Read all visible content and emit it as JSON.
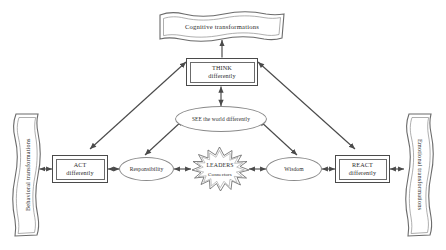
{
  "diagram": {
    "colors": {
      "stroke_strong": "#4a4a4a",
      "stroke_light": "#8a8a8a",
      "text": "#2b2b2b",
      "background": "#ffffff"
    },
    "banners": {
      "top": {
        "label": "Cognitive transformations",
        "shape": "wavy-ribbon-horizontal"
      },
      "left": {
        "label": "Behavioral transformations",
        "shape": "wavy-ribbon-vertical",
        "text_direction": "bottom-to-top"
      },
      "right": {
        "label": "Emotional transformations",
        "shape": "wavy-ribbon-vertical",
        "text_direction": "top-to-bottom"
      }
    },
    "boxes": {
      "think": {
        "line1": "THINK",
        "line2": "differently",
        "shape": "double-border-rectangle"
      },
      "act": {
        "line1": "ACT",
        "line2": "differently",
        "shape": "double-border-rectangle"
      },
      "react": {
        "line1": "REACT",
        "line2": "differently",
        "shape": "double-border-rectangle"
      }
    },
    "ellipses": {
      "see": {
        "label": "SEE the world differently"
      },
      "responsibility": {
        "label": "Responsibility"
      },
      "wisdom": {
        "label": "Wisdom"
      }
    },
    "star": {
      "line1": "LEADERS",
      "line2": "Connectors",
      "shape": "explosion-starburst"
    },
    "connectors": [
      {
        "from": "see",
        "to": "think",
        "style": "double-arrow-vertical"
      },
      {
        "from": "think",
        "to": "cognitive-transformations",
        "style": "single-arrow-up"
      },
      {
        "from": "act",
        "to": "think",
        "style": "double-arrow-diagonal"
      },
      {
        "from": "think",
        "to": "react",
        "style": "double-arrow-diagonal"
      },
      {
        "from": "responsibility",
        "to": "see",
        "style": "double-arrow-diagonal"
      },
      {
        "from": "see",
        "to": "wisdom",
        "style": "double-arrow-diagonal"
      },
      {
        "from": "behavioral-transformations",
        "to": "act",
        "style": "double-arrow-horizontal"
      },
      {
        "from": "act",
        "to": "responsibility",
        "style": "double-arrow-horizontal"
      },
      {
        "from": "responsibility",
        "to": "leaders",
        "style": "double-arrow-horizontal"
      },
      {
        "from": "leaders",
        "to": "wisdom",
        "style": "double-arrow-horizontal"
      },
      {
        "from": "wisdom",
        "to": "react",
        "style": "double-arrow-horizontal"
      },
      {
        "from": "react",
        "to": "emotional-transformations",
        "style": "double-arrow-horizontal"
      }
    ]
  }
}
